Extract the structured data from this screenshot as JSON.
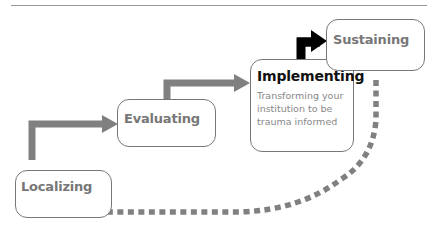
{
  "diagram": {
    "steps": [
      {
        "label": "Localizing"
      },
      {
        "label": "Evaluating"
      },
      {
        "label": "Implementing",
        "description": "Transforming your institution to be trauma informed"
      },
      {
        "label": "Sustaining"
      }
    ],
    "colors": {
      "arrow_gray": "#808080",
      "arrow_black": "#000000",
      "box_border": "#777777",
      "text_gray": "#777777",
      "text_dark": "#111111"
    }
  }
}
